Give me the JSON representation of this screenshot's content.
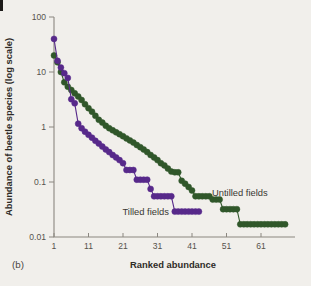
{
  "figure_label": "(b)",
  "colors": {
    "background": "#f1efeb",
    "axis": "#8b8780",
    "tilled": "#57298a",
    "untilled": "#30572a",
    "text": "#2e2b27"
  },
  "chart_data": {
    "type": "line",
    "title": "",
    "xlabel": "Ranked abundance",
    "ylabel": "Abundance of beetle species (log scale)",
    "y_scale": "log",
    "ylim": [
      0.01,
      100
    ],
    "xlim": [
      1,
      69
    ],
    "grid": false,
    "legend_position": "inline-annotations",
    "y_ticks": [
      {
        "value": 100,
        "label": "100"
      },
      {
        "value": 10,
        "label": "10"
      },
      {
        "value": 1,
        "label": "1"
      },
      {
        "value": 0.1,
        "label": "0.1"
      },
      {
        "value": 0.01,
        "label": "0.01"
      }
    ],
    "x_ticks": [
      {
        "value": 1,
        "label": "1"
      },
      {
        "value": 11,
        "label": "11"
      },
      {
        "value": 21,
        "label": "21"
      },
      {
        "value": 31,
        "label": "31"
      },
      {
        "value": 41,
        "label": "41"
      },
      {
        "value": 51,
        "label": "51"
      },
      {
        "value": 61,
        "label": "61"
      }
    ],
    "series": [
      {
        "name": "Untilled fields",
        "color": "#30572a",
        "x_start": 1,
        "values": [
          20,
          15,
          10,
          6.5,
          5.4,
          4.7,
          4.1,
          3.6,
          3.1,
          2.6,
          2.2,
          1.9,
          1.6,
          1.35,
          1.2,
          1.05,
          0.95,
          0.87,
          0.8,
          0.74,
          0.68,
          0.62,
          0.57,
          0.52,
          0.47,
          0.43,
          0.39,
          0.35,
          0.31,
          0.28,
          0.25,
          0.22,
          0.2,
          0.175,
          0.155,
          0.15,
          0.15,
          0.105,
          0.093,
          0.081,
          0.07,
          0.055,
          0.055,
          0.055,
          0.055,
          0.055,
          0.048,
          0.048,
          0.048,
          0.032,
          0.032,
          0.032,
          0.032,
          0.032,
          0.017,
          0.017,
          0.017,
          0.017,
          0.017,
          0.017,
          0.017,
          0.017,
          0.017,
          0.017,
          0.017,
          0.017,
          0.017,
          0.017
        ]
      },
      {
        "name": "Tilled fields",
        "color": "#57298a",
        "x_start": 1,
        "values": [
          40,
          16,
          12,
          9.5,
          7.8,
          3.2,
          2.7,
          1.15,
          0.95,
          0.82,
          0.72,
          0.64,
          0.56,
          0.5,
          0.44,
          0.39,
          0.35,
          0.31,
          0.28,
          0.25,
          0.22,
          0.165,
          0.165,
          0.165,
          0.11,
          0.11,
          0.11,
          0.11,
          0.075,
          0.055,
          0.055,
          0.055,
          0.055,
          0.055,
          0.055,
          0.029,
          0.029,
          0.029,
          0.029,
          0.029,
          0.029,
          0.029,
          0.029
        ]
      }
    ]
  }
}
